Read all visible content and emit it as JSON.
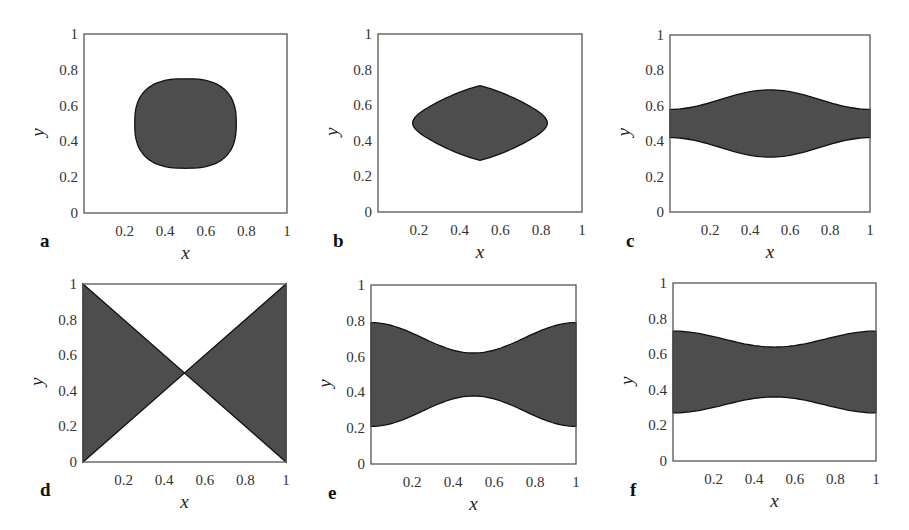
{
  "figure": {
    "fill_color": "#4d4d4d",
    "outline_color": "#111111",
    "axes_color": "#555555"
  },
  "chart_data": [
    {
      "panel": "a",
      "type": "area",
      "title": "",
      "xlabel": "x",
      "ylabel": "y",
      "xlim": [
        0,
        1
      ],
      "ylim": [
        0,
        1
      ],
      "xticks": [
        "0.2",
        "0.4",
        "0.6",
        "0.8",
        "1"
      ],
      "yticks": [
        "0",
        "0.2",
        "0.4",
        "0.6",
        "0.8",
        "1"
      ],
      "grid": false,
      "shape": "rounded-diamond",
      "region": {
        "x_range": [
          0.25,
          0.75
        ],
        "y_range": [
          0.25,
          0.75
        ],
        "center": [
          0.5,
          0.5
        ]
      },
      "box": {
        "left": 84,
        "top": 34,
        "right": 287,
        "bottom": 213
      },
      "label_pos": {
        "x": 40,
        "y": 247
      }
    },
    {
      "panel": "b",
      "type": "area",
      "title": "",
      "xlabel": "x",
      "ylabel": "y",
      "xlim": [
        0,
        1
      ],
      "ylim": [
        0,
        1
      ],
      "xticks": [
        "0.2",
        "0.4",
        "0.6",
        "0.8",
        "1"
      ],
      "yticks": [
        "0",
        "0.2",
        "0.4",
        "0.6",
        "0.8",
        "1"
      ],
      "grid": false,
      "shape": "lens",
      "region": {
        "x_range": [
          0.17,
          0.83
        ],
        "y_range": [
          0.29,
          0.71
        ],
        "center": [
          0.5,
          0.5
        ]
      },
      "box": {
        "left": 378,
        "top": 34,
        "right": 582,
        "bottom": 212
      },
      "label_pos": {
        "x": 333,
        "y": 247
      }
    },
    {
      "panel": "c",
      "type": "area",
      "title": "",
      "xlabel": "x",
      "ylabel": "y",
      "xlim": [
        0,
        1
      ],
      "ylim": [
        0,
        1
      ],
      "xticks": [
        "0.2",
        "0.4",
        "0.6",
        "0.8",
        "1"
      ],
      "yticks": [
        "0",
        "0.2",
        "0.4",
        "0.6",
        "0.8",
        "1"
      ],
      "grid": false,
      "shape": "bulging-band",
      "upper_boundary": {
        "x": [
          0,
          0.5,
          1
        ],
        "y": [
          0.58,
          0.69,
          0.58
        ]
      },
      "lower_boundary": {
        "x": [
          0,
          0.5,
          1
        ],
        "y": [
          0.42,
          0.31,
          0.42
        ]
      },
      "box": {
        "left": 670,
        "top": 35,
        "right": 870,
        "bottom": 212
      },
      "label_pos": {
        "x": 626,
        "y": 247
      }
    },
    {
      "panel": "d",
      "type": "area",
      "title": "",
      "xlabel": "x",
      "ylabel": "y",
      "xlim": [
        0,
        1
      ],
      "ylim": [
        0,
        1
      ],
      "xticks": [
        "0.2",
        "0.4",
        "0.6",
        "0.8",
        "1"
      ],
      "yticks": [
        "0",
        "0.2",
        "0.4",
        "0.6",
        "0.8",
        "1"
      ],
      "grid": false,
      "shape": "bowtie",
      "upper_boundary": {
        "x": [
          0,
          0.5,
          1
        ],
        "y": [
          1.0,
          0.5,
          1.0
        ]
      },
      "lower_boundary": {
        "x": [
          0,
          0.5,
          1
        ],
        "y": [
          0.0,
          0.5,
          0.0
        ]
      },
      "box": {
        "left": 83,
        "top": 284,
        "right": 286,
        "bottom": 462
      },
      "label_pos": {
        "x": 40,
        "y": 496
      }
    },
    {
      "panel": "e",
      "type": "area",
      "title": "",
      "xlabel": "x",
      "ylabel": "y",
      "xlim": [
        0,
        1
      ],
      "ylim": [
        0,
        1
      ],
      "xticks": [
        "0.2",
        "0.4",
        "0.6",
        "0.8",
        "1"
      ],
      "yticks": [
        "0",
        "0.2",
        "0.4",
        "0.6",
        "0.8",
        "1"
      ],
      "grid": false,
      "shape": "pinched-band",
      "upper_boundary": {
        "x": [
          0,
          0.5,
          1
        ],
        "y": [
          0.79,
          0.62,
          0.79
        ]
      },
      "lower_boundary": {
        "x": [
          0,
          0.5,
          1
        ],
        "y": [
          0.21,
          0.38,
          0.21
        ]
      },
      "box": {
        "left": 371,
        "top": 285,
        "right": 576,
        "bottom": 464
      },
      "label_pos": {
        "x": 328,
        "y": 499
      }
    },
    {
      "panel": "f",
      "type": "area",
      "title": "",
      "xlabel": "x",
      "ylabel": "y",
      "xlim": [
        0,
        1
      ],
      "ylim": [
        0,
        1
      ],
      "xticks": [
        "0.2",
        "0.4",
        "0.6",
        "0.8",
        "1"
      ],
      "yticks": [
        "0",
        "0.2",
        "0.4",
        "0.6",
        "0.8",
        "1"
      ],
      "grid": false,
      "shape": "pinched-band",
      "upper_boundary": {
        "x": [
          0,
          0.5,
          1
        ],
        "y": [
          0.73,
          0.64,
          0.73
        ]
      },
      "lower_boundary": {
        "x": [
          0,
          0.5,
          1
        ],
        "y": [
          0.27,
          0.36,
          0.27
        ]
      },
      "box": {
        "left": 673,
        "top": 283,
        "right": 876,
        "bottom": 461
      },
      "label_pos": {
        "x": 630,
        "y": 496
      }
    }
  ]
}
